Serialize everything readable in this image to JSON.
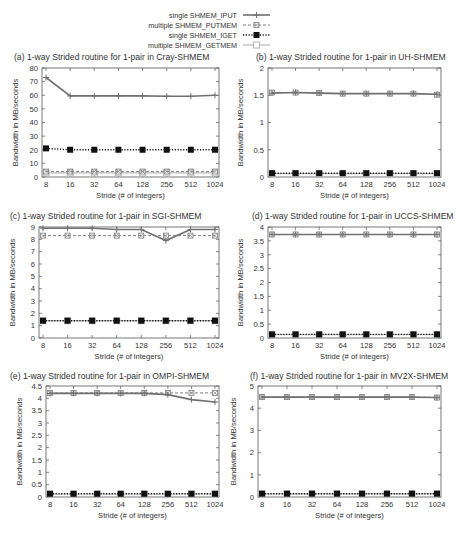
{
  "legend": {
    "entries": [
      {
        "label": "single SHMEM_IPUT",
        "style": "solid",
        "marker": "plus"
      },
      {
        "label": "multiple SHMEM_PUTMEM",
        "style": "dashed",
        "marker": "x-square"
      },
      {
        "label": "single SHMEM_IGET",
        "style": "dotted",
        "marker": "filled-square"
      },
      {
        "label": "multiple SHMEM_GETMEM",
        "style": "solid-light",
        "marker": "open-square"
      }
    ]
  },
  "chart_data": [
    {
      "type": "line",
      "title": "(a) 1-way Strided routine for 1-pair in Cray-SHMEM",
      "xlabel": "Stride (# of integers)",
      "ylabel": "Bandwidth in MB/seconds",
      "categories": [
        "8",
        "16",
        "32",
        "64",
        "128",
        "256",
        "512",
        "1024"
      ],
      "ylim": [
        0,
        80
      ],
      "yticks": [
        "0",
        "10",
        "20",
        "30",
        "40",
        "50",
        "60",
        "70",
        "80"
      ],
      "series": [
        {
          "name": "single SHMEM_IPUT",
          "values": [
            73,
            59.5,
            59.5,
            59.5,
            59.5,
            59.3,
            59.3,
            60
          ]
        },
        {
          "name": "multiple SHMEM_PUTMEM",
          "values": [
            4,
            4,
            4,
            4,
            4,
            4,
            4,
            4
          ]
        },
        {
          "name": "single SHMEM_IGET",
          "values": [
            21,
            20,
            20,
            20,
            20,
            20,
            20,
            20
          ]
        },
        {
          "name": "multiple SHMEM_GETMEM",
          "values": [
            3,
            3,
            3,
            3,
            3,
            3,
            3,
            3
          ]
        }
      ],
      "legend_position": "top"
    },
    {
      "type": "line",
      "title": "(b) 1-way Strided routine for 1-pair in UH-SHMEM",
      "xlabel": "Stride (# of integers)",
      "ylabel": "Bandwidth in MB/seconds",
      "categories": [
        "8",
        "16",
        "32",
        "64",
        "128",
        "256",
        "512",
        "1024"
      ],
      "ylim": [
        0,
        2
      ],
      "yticks": [
        "0",
        "0.5",
        "1",
        "1.5",
        "2"
      ],
      "series": [
        {
          "name": "single SHMEM_IPUT",
          "values": [
            1.54,
            1.55,
            1.54,
            1.53,
            1.53,
            1.53,
            1.53,
            1.52
          ]
        },
        {
          "name": "multiple SHMEM_PUTMEM",
          "values": [
            1.55,
            1.55,
            1.54,
            1.53,
            1.53,
            1.53,
            1.53,
            1.51
          ]
        },
        {
          "name": "single SHMEM_IGET",
          "values": [
            0.07,
            0.07,
            0.07,
            0.07,
            0.07,
            0.07,
            0.07,
            0.07
          ]
        },
        {
          "name": "multiple SHMEM_GETMEM",
          "values": [
            0.06,
            0.06,
            0.06,
            0.06,
            0.06,
            0.06,
            0.06,
            0.06
          ]
        }
      ]
    },
    {
      "type": "line",
      "title": "(c) 1-way Strided routine for 1-pair in SGI-SHMEM",
      "xlabel": "Stride (# of integers)",
      "ylabel": "Bandwidth in MB/seconds",
      "categories": [
        "8",
        "16",
        "32",
        "64",
        "128",
        "256",
        "512",
        "1024"
      ],
      "ylim": [
        0,
        9
      ],
      "yticks": [
        "0",
        "1",
        "2",
        "3",
        "4",
        "5",
        "6",
        "7",
        "8",
        "9"
      ],
      "series": [
        {
          "name": "single SHMEM_IPUT",
          "values": [
            8.9,
            8.9,
            8.9,
            8.8,
            8.8,
            7.9,
            8.8,
            8.8
          ]
        },
        {
          "name": "multiple SHMEM_PUTMEM",
          "values": [
            8.3,
            8.3,
            8.3,
            8.3,
            8.3,
            8.3,
            8.3,
            8.3
          ]
        },
        {
          "name": "single SHMEM_IGET",
          "values": [
            1.4,
            1.4,
            1.4,
            1.4,
            1.4,
            1.4,
            1.4,
            1.4
          ]
        },
        {
          "name": "multiple SHMEM_GETMEM",
          "values": [
            1.4,
            1.4,
            1.4,
            1.4,
            1.4,
            1.4,
            1.4,
            1.4
          ]
        }
      ]
    },
    {
      "type": "line",
      "title": "(d) 1-way Strided routine for 1-pair in UCCS-SHMEM",
      "xlabel": "Stride (# of integers)",
      "ylabel": "Bandwidth in MB/seconds",
      "categories": [
        "8",
        "16",
        "32",
        "64",
        "128",
        "256",
        "512",
        "1024"
      ],
      "ylim": [
        0,
        4
      ],
      "yticks": [
        "0",
        "0.5",
        "1",
        "1.5",
        "2",
        "2.5",
        "3",
        "3.5",
        "4"
      ],
      "series": [
        {
          "name": "single SHMEM_IPUT",
          "values": [
            3.73,
            3.73,
            3.73,
            3.73,
            3.73,
            3.73,
            3.73,
            3.73
          ]
        },
        {
          "name": "multiple SHMEM_PUTMEM",
          "values": [
            3.73,
            3.73,
            3.73,
            3.73,
            3.73,
            3.73,
            3.73,
            3.73
          ]
        },
        {
          "name": "single SHMEM_IGET",
          "values": [
            0.13,
            0.13,
            0.13,
            0.13,
            0.13,
            0.13,
            0.13,
            0.13
          ]
        },
        {
          "name": "multiple SHMEM_GETMEM",
          "values": [
            0.12,
            0.12,
            0.12,
            0.12,
            0.12,
            0.12,
            0.12,
            0.12
          ]
        }
      ]
    },
    {
      "type": "line",
      "title": "(e) 1-way Strided routine for 1-pair in OMPI-SHMEM",
      "xlabel": "Stride (# of integers)",
      "ylabel": "Bandwidth in MB/seconds",
      "categories": [
        "8",
        "16",
        "32",
        "64",
        "128",
        "256",
        "512",
        "1024"
      ],
      "ylim": [
        0,
        4.5
      ],
      "yticks": [
        "0",
        "0.5",
        "1",
        "1.5",
        "2",
        "2.5",
        "3",
        "3.5",
        "4",
        "4.5"
      ],
      "series": [
        {
          "name": "single SHMEM_IPUT",
          "values": [
            4.2,
            4.2,
            4.2,
            4.2,
            4.2,
            4.15,
            3.95,
            3.85
          ]
        },
        {
          "name": "multiple SHMEM_PUTMEM",
          "values": [
            4.22,
            4.22,
            4.22,
            4.22,
            4.22,
            4.22,
            4.22,
            4.22
          ]
        },
        {
          "name": "single SHMEM_IGET",
          "values": [
            0.13,
            0.13,
            0.13,
            0.13,
            0.13,
            0.13,
            0.13,
            0.13
          ]
        },
        {
          "name": "multiple SHMEM_GETMEM",
          "values": [
            0.12,
            0.12,
            0.12,
            0.12,
            0.12,
            0.12,
            0.12,
            0.12
          ]
        }
      ]
    },
    {
      "type": "line",
      "title": "(f) 1-way Strided routine for 1-pair in MV2X-SHMEM",
      "xlabel": "Stride (# of integers)",
      "ylabel": "Bandwidth in MB/seconds",
      "categories": [
        "8",
        "16",
        "32",
        "64",
        "128",
        "256",
        "512",
        "1024"
      ],
      "ylim": [
        0,
        5
      ],
      "yticks": [
        "0",
        "1",
        "2",
        "3",
        "4",
        "5"
      ],
      "series": [
        {
          "name": "single SHMEM_IPUT",
          "values": [
            4.5,
            4.5,
            4.5,
            4.5,
            4.5,
            4.5,
            4.5,
            4.48
          ]
        },
        {
          "name": "multiple SHMEM_PUTMEM",
          "values": [
            4.5,
            4.5,
            4.5,
            4.5,
            4.5,
            4.5,
            4.5,
            4.48
          ]
        },
        {
          "name": "single SHMEM_IGET",
          "values": [
            0.15,
            0.15,
            0.15,
            0.15,
            0.15,
            0.15,
            0.15,
            0.15
          ]
        },
        {
          "name": "multiple SHMEM_GETMEM",
          "values": [
            0.14,
            0.14,
            0.14,
            0.14,
            0.14,
            0.14,
            0.14,
            0.14
          ]
        }
      ]
    }
  ],
  "colors": {
    "iput": "#707070",
    "putmem": "#808080",
    "iget": "#111111",
    "getmem": "#b8b8b8",
    "axis": "#555555",
    "text": "#333333"
  }
}
